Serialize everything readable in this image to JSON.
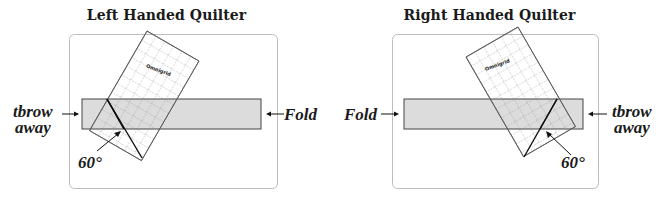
{
  "figure": {
    "panels": [
      {
        "title": "Left Handed Quilter",
        "left_label": "throw away",
        "left_label_line1": "tbrow",
        "left_label_line2": "away",
        "right_label": "Fold",
        "angle_label": "60°",
        "ruler_brand": "Omnigrid"
      },
      {
        "title": "Right Handed Quilter",
        "left_label": "Fold",
        "right_label_line1": "tbrow",
        "right_label_line2": "away",
        "angle_label": "60°",
        "ruler_brand": "Omnigrid"
      }
    ],
    "colors": {
      "fabric_strip": "#dcdcdc",
      "outline": "#444444",
      "board_border": "#bbbbbb",
      "ruler_grid": "#777777",
      "cut_line": "#111111"
    }
  }
}
